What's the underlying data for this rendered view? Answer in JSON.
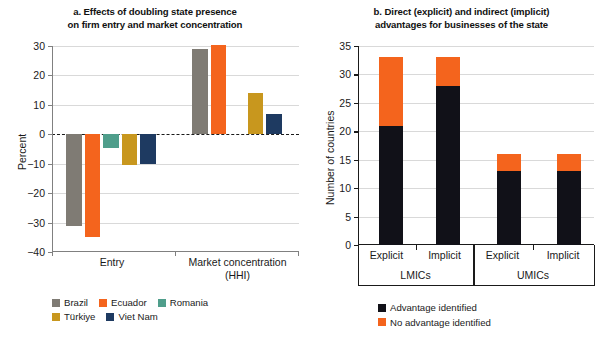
{
  "figure": {
    "width": 613,
    "height": 346,
    "background": "#ffffff"
  },
  "chart_data": [
    {
      "id": "panel-a",
      "type": "bar",
      "title": "a. Effects of doubling state presence on firm entry and market concentration",
      "title_line1": "a. Effects of doubling state presence",
      "title_line2": "on firm entry and market concentration",
      "xlabel": "",
      "ylabel": "Percent",
      "categories": [
        "Entry",
        "Market concentration (HHI)"
      ],
      "category_labels": [
        {
          "line1": "Entry",
          "line2": ""
        },
        {
          "line1": "Market concentration",
          "line2": "(HHI)"
        }
      ],
      "ylim": [
        -40,
        30
      ],
      "yticks": [
        30,
        20,
        10,
        0,
        -10,
        -20,
        -30,
        -40
      ],
      "ytick_labels": [
        "30",
        "20",
        "10",
        "0",
        "−10",
        "−20",
        "−30",
        "−40"
      ],
      "grid": true,
      "zero_line": true,
      "legend_position": "bottom-left",
      "series": [
        {
          "name": "Brazil",
          "color": "#7f7b74",
          "values": [
            -31.2,
            29.0
          ]
        },
        {
          "name": "Ecuador",
          "color": "#f4641d",
          "values": [
            -35.0,
            30.3
          ]
        },
        {
          "name": "Romania",
          "color": "#4f9e8b",
          "values": [
            -4.6,
            null
          ]
        },
        {
          "name": "Türkiye",
          "color": "#c8971e",
          "values": [
            -10.5,
            14.0
          ]
        },
        {
          "name": "Viet Nam",
          "color": "#1e3a61",
          "values": [
            -10.1,
            7.0
          ]
        }
      ]
    },
    {
      "id": "panel-b",
      "type": "bar",
      "stacked": true,
      "title": "b. Direct (explicit) and indirect (implicit) advantages for businesses of the state",
      "title_line1": "b. Direct (explicit) and indirect (implicit)",
      "title_line2": "advantages for businesses of the state",
      "xlabel": "",
      "ylabel": "Number of countries",
      "categories": [
        "Explicit",
        "Implicit",
        "Explicit",
        "Implicit"
      ],
      "groups": [
        {
          "label": "LMICs",
          "categories": [
            "Explicit",
            "Implicit"
          ]
        },
        {
          "label": "UMICs",
          "categories": [
            "Explicit",
            "Implicit"
          ]
        }
      ],
      "ylim": [
        0,
        35
      ],
      "yticks": [
        0,
        5,
        10,
        15,
        20,
        25,
        30,
        35
      ],
      "ytick_labels": [
        "0",
        "5",
        "10",
        "15",
        "20",
        "25",
        "30",
        "35"
      ],
      "grid": true,
      "legend_position": "bottom-center",
      "series": [
        {
          "name": "Advantage identified",
          "color": "#111118",
          "values": [
            21,
            28,
            13,
            13
          ]
        },
        {
          "name": "No advantage identified",
          "color": "#f4641d",
          "values": [
            12,
            5,
            3,
            3
          ]
        }
      ],
      "totals": [
        33,
        33,
        16,
        16
      ]
    }
  ]
}
